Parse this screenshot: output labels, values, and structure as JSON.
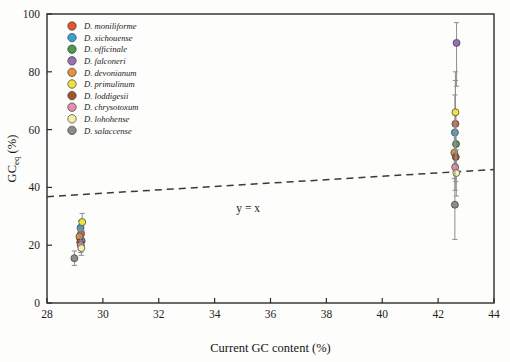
{
  "chart_data": {
    "type": "scatter",
    "title": "",
    "xlabel": "Current GC content (%)",
    "ylabel": "GCeq (%)",
    "ylabel_main": "GC",
    "ylabel_sub": "eq",
    "ylabel_unit": " (%)",
    "xlim": [
      28,
      44
    ],
    "ylim": [
      0,
      100
    ],
    "xticks": [
      28,
      30,
      32,
      34,
      36,
      38,
      40,
      42,
      44
    ],
    "yticks": [
      0,
      20,
      40,
      60,
      80,
      100
    ],
    "grid": false,
    "legend_position": "top-left",
    "annotations": [
      {
        "text": "y = x",
        "x": 35.2,
        "y": 31.5
      }
    ],
    "reference_line": {
      "label": "y = x",
      "style": "dashed",
      "x_start": 28,
      "y_start": 36.8,
      "x_end": 44,
      "y_end": 46.2
    },
    "series": [
      {
        "name": "D. moniliforme",
        "color": "#e1562a",
        "points": [
          {
            "x": 29.22,
            "y": 24.0,
            "err_low": 21.0,
            "err_high": 27.0
          },
          {
            "x": 42.62,
            "y": 62.0,
            "err_low": 48.0,
            "err_high": 77.0
          }
        ]
      },
      {
        "name": "D. xichouense",
        "color": "#3a9fd4",
        "points": [
          {
            "x": 29.2,
            "y": 26.0,
            "err_low": 23.5,
            "err_high": 28.5
          },
          {
            "x": 42.6,
            "y": 59.0,
            "err_low": 47.0,
            "err_high": 72.0
          }
        ]
      },
      {
        "name": "D. officinale",
        "color": "#4f9a4a",
        "points": [
          {
            "x": 29.18,
            "y": 22.5,
            "err_low": 20.0,
            "err_high": 25.0
          },
          {
            "x": 42.64,
            "y": 55.0,
            "err_low": 45.0,
            "err_high": 66.0
          }
        ]
      },
      {
        "name": "D. falconeri",
        "color": "#9a6fb0",
        "points": [
          {
            "x": 29.24,
            "y": 21.5,
            "err_low": 19.0,
            "err_high": 24.0
          },
          {
            "x": 42.66,
            "y": 90.0,
            "err_low": 75.0,
            "err_high": 97.0
          }
        ]
      },
      {
        "name": "D. devonianum",
        "color": "#e8913a",
        "points": [
          {
            "x": 29.16,
            "y": 23.0,
            "err_low": 20.5,
            "err_high": 25.5
          },
          {
            "x": 42.58,
            "y": 52.0,
            "err_low": 43.0,
            "err_high": 62.0
          }
        ]
      },
      {
        "name": "D. primulinum",
        "color": "#ece33f",
        "points": [
          {
            "x": 29.26,
            "y": 28.0,
            "err_low": 25.0,
            "err_high": 31.0
          },
          {
            "x": 42.62,
            "y": 66.0,
            "err_low": 52.0,
            "err_high": 80.0
          }
        ]
      },
      {
        "name": "D. loddigesii",
        "color": "#a0562c",
        "points": [
          {
            "x": 29.19,
            "y": 21.0,
            "err_low": 18.5,
            "err_high": 23.5
          },
          {
            "x": 42.63,
            "y": 50.5,
            "err_low": 42.0,
            "err_high": 59.0
          }
        ]
      },
      {
        "name": "D. chrysotoxum",
        "color": "#e48fb1",
        "points": [
          {
            "x": 29.21,
            "y": 20.0,
            "err_low": 17.5,
            "err_high": 22.5
          },
          {
            "x": 42.61,
            "y": 47.0,
            "err_low": 39.0,
            "err_high": 55.0
          }
        ]
      },
      {
        "name": "D. lohohense",
        "color": "#f2f0a8",
        "points": [
          {
            "x": 29.23,
            "y": 19.0,
            "err_low": 16.5,
            "err_high": 21.5
          },
          {
            "x": 42.65,
            "y": 45.0,
            "err_low": 37.0,
            "err_high": 53.0
          }
        ]
      },
      {
        "name": "D. salaccense",
        "color": "#8c8c8c",
        "points": [
          {
            "x": 28.98,
            "y": 15.5,
            "err_low": 13.0,
            "err_high": 18.0
          },
          {
            "x": 42.6,
            "y": 34.0,
            "err_low": 22.0,
            "err_high": 46.0
          }
        ]
      }
    ]
  }
}
